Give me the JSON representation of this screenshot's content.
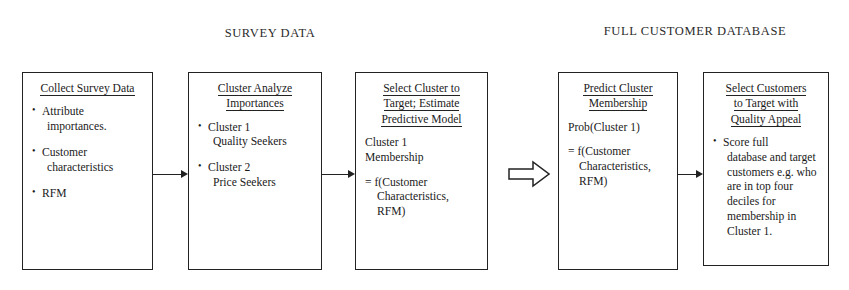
{
  "diagram": {
    "title_left": "SURVEY DATA",
    "title_right": "FULL CUSTOMER DATABASE",
    "stroke_color": "#222222",
    "background": "#ffffff"
  },
  "boxes": [
    {
      "id": "collect-survey-data",
      "title_lines": [
        "Collect Survey Data"
      ],
      "bullets": [
        {
          "main": "Attribute",
          "sub": "importances."
        },
        {
          "main": "Customer",
          "sub": "characteristics"
        },
        {
          "main": "RFM",
          "sub": ""
        }
      ]
    },
    {
      "id": "cluster-analyze-importances",
      "title_lines": [
        "Cluster Analyze",
        "Importances"
      ],
      "bullets": [
        {
          "main": "Cluster 1",
          "sub": "Quality Seekers"
        },
        {
          "main": "Cluster 2",
          "sub": "Price Seekers"
        }
      ]
    },
    {
      "id": "select-cluster-to-target",
      "title_lines": [
        "Select Cluster to",
        "Target; Estimate",
        "Predictive Model"
      ],
      "paras": [
        {
          "line1": "Cluster 1",
          "line2": "Membership",
          "line3": ""
        },
        {
          "line1": "=  f(Customer",
          "line2": "Characteristics,",
          "line3": "RFM)"
        }
      ]
    },
    {
      "id": "predict-cluster-membership",
      "title_lines": [
        "Predict Cluster",
        "Membership"
      ],
      "paras": [
        {
          "line1": "Prob(Cluster 1)",
          "line2": "",
          "line3": ""
        },
        {
          "line1": "= f(Customer",
          "line2": "Characteristics,",
          "line3": "RFM)"
        }
      ]
    },
    {
      "id": "select-customers-to-target",
      "title_lines": [
        "Select Customers",
        "to Target with",
        "Quality Appeal"
      ],
      "bullets": [
        {
          "main": "Score full",
          "sub": "database and target customers e.g. who are in top four deciles for membership in Cluster 1."
        }
      ]
    }
  ],
  "connectors": [
    {
      "id": "arrow-collect-to-cluster",
      "kind": "solid-arrow"
    },
    {
      "id": "arrow-cluster-to-select",
      "kind": "solid-arrow"
    },
    {
      "id": "arrow-select-to-predict",
      "kind": "hollow-block-arrow"
    },
    {
      "id": "arrow-predict-to-customers",
      "kind": "solid-arrow"
    }
  ]
}
